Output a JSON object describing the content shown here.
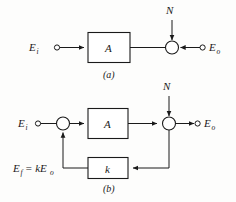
{
  "figure": {
    "type": "block-diagram",
    "background_color": "#fdfdfc",
    "line_color": "#1a1a1a",
    "panels": [
      {
        "id": "a",
        "caption": "(a)",
        "input_label": "E",
        "input_sub": "i",
        "output_label": "E",
        "output_sub": "o",
        "noise_label": "N",
        "block_label": "A",
        "blocks": [
          "A"
        ],
        "summing_junctions": 1,
        "terminals": [
          "E_i",
          "E_o"
        ]
      },
      {
        "id": "b",
        "caption": "(b)",
        "input_label": "E",
        "input_sub": "i",
        "output_label": "E",
        "output_sub": "o",
        "noise_label": "N",
        "block_label": "A",
        "feedback_block_label": "k",
        "feedback_label": "E",
        "feedback_label_sub": "f",
        "feedback_label_eq": "= kE",
        "feedback_label_eq_sub": "o",
        "blocks": [
          "A",
          "k"
        ],
        "summing_junctions": 2,
        "terminals": [
          "E_i",
          "E_o"
        ]
      }
    ]
  }
}
